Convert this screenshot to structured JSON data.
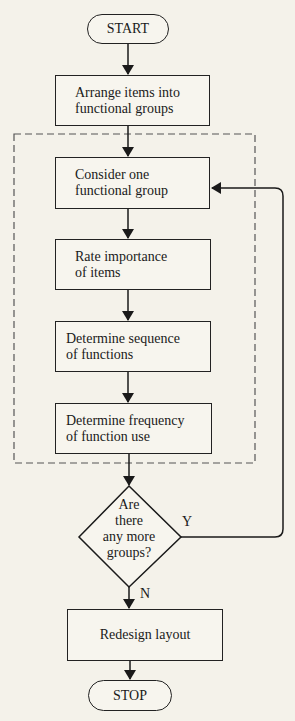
{
  "flowchart": {
    "start": "START",
    "stop": "STOP",
    "steps": [
      {
        "id": "arrange",
        "line1": "Arrange items into",
        "line2": "functional groups"
      },
      {
        "id": "consider",
        "line1": "Consider one",
        "line2": "functional group"
      },
      {
        "id": "rate",
        "line1": "Rate importance",
        "line2": "of items"
      },
      {
        "id": "sequence",
        "line1": "Determine sequence",
        "line2": "of functions"
      },
      {
        "id": "frequency",
        "line1": "Determine frequency",
        "line2": "of function use"
      },
      {
        "id": "redesign",
        "line1": "Redesign layout"
      }
    ],
    "decision": {
      "lines": [
        "Are",
        "there",
        "any more",
        "groups?"
      ],
      "yes_label": "Y",
      "no_label": "N"
    },
    "loop_group": "dashed-loop-region"
  }
}
